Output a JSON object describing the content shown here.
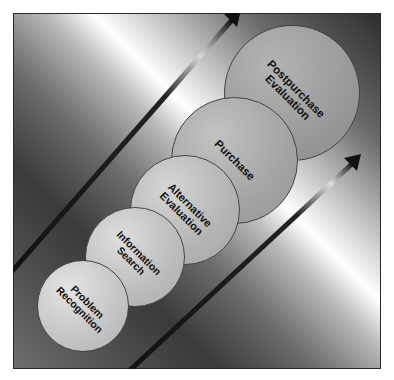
{
  "diagram": {
    "type": "consumer-decision-process",
    "stages": [
      {
        "label": "Problem\nRecognition",
        "order": 1
      },
      {
        "label": "Information\nSearch",
        "order": 2
      },
      {
        "label": "Alternative\nEvaluation",
        "order": 3
      },
      {
        "label": "Purchase",
        "order": 4
      },
      {
        "label": "Postpurchase\nEvaluation",
        "order": 5
      }
    ],
    "arrows": [
      {
        "direction": "up-right",
        "position": "upper-left"
      },
      {
        "direction": "up-right",
        "position": "lower-right"
      }
    ],
    "colors": {
      "frame_border": "#2a2a2a",
      "arrow": "#1a1a1a",
      "text": "#111111"
    }
  }
}
